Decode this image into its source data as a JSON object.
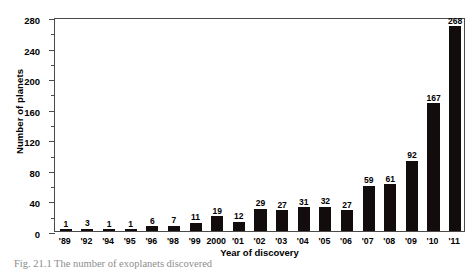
{
  "figure": {
    "caption": "Fig. 21.1 The number of exoplanets discovered",
    "ylabel": "Number of planets",
    "xlabel": "Year of discovery"
  },
  "chart_data": {
    "type": "bar",
    "title": "",
    "xlabel": "Year of discovery",
    "ylabel": "Number of planets",
    "ylim": [
      0,
      280
    ],
    "ytick_labels": [
      "0",
      "40",
      "80",
      "120",
      "160",
      "200",
      "240",
      "280"
    ],
    "ytick_values": [
      0,
      40,
      80,
      120,
      160,
      200,
      240,
      280
    ],
    "yminor_values": [
      20,
      60,
      100,
      140,
      180,
      220,
      260
    ],
    "grid": false,
    "legend": null,
    "bar_color": "#120d0c",
    "axis_color": "#4a4a4a",
    "categories": [
      "'89",
      "'92",
      "'94",
      "'95",
      "'96",
      "'98",
      "'99",
      "2000",
      "'01",
      "'02",
      "'03",
      "'04",
      "'05",
      "'06",
      "'07",
      "'08",
      "'09",
      "'10",
      "'11"
    ],
    "values": [
      1,
      3,
      1,
      1,
      6,
      7,
      11,
      19,
      12,
      29,
      27,
      31,
      32,
      27,
      59,
      61,
      92,
      167,
      268
    ],
    "data_labels": [
      "1",
      "3",
      "1",
      "1",
      "6",
      "7",
      "11",
      "19",
      "12",
      "29",
      "27",
      "31",
      "32",
      "27",
      "59",
      "61",
      "92",
      "167",
      "268"
    ]
  }
}
